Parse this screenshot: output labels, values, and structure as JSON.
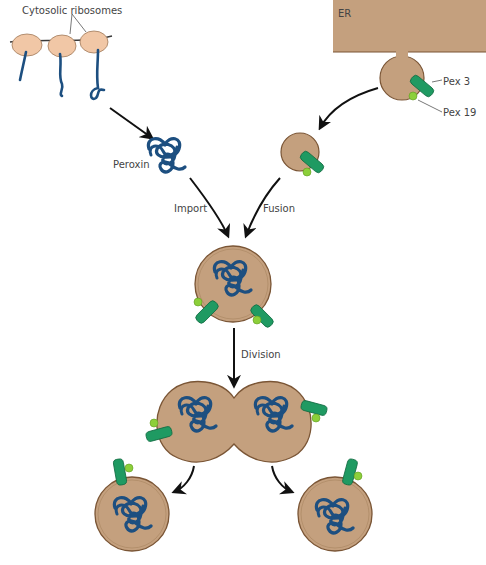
{
  "labels": {
    "cytosolic_ribosomes": "Cytosolic ribosomes",
    "er": "ER",
    "pex3": "Pex 3",
    "pex19": "Pex 19",
    "peroxin": "Peroxin",
    "import": "Import",
    "fusion": "Fusion",
    "division": "Division"
  },
  "colors": {
    "membrane_fill": "#c4a07e",
    "membrane_stroke": "#7a5535",
    "ribosome_fill": "#f1c7a6",
    "peroxin_blue": "#1d4f80",
    "pex3_green": "#1f9a62",
    "pex19_lightgreen": "#8ccf3a",
    "arrow": "#111111"
  }
}
